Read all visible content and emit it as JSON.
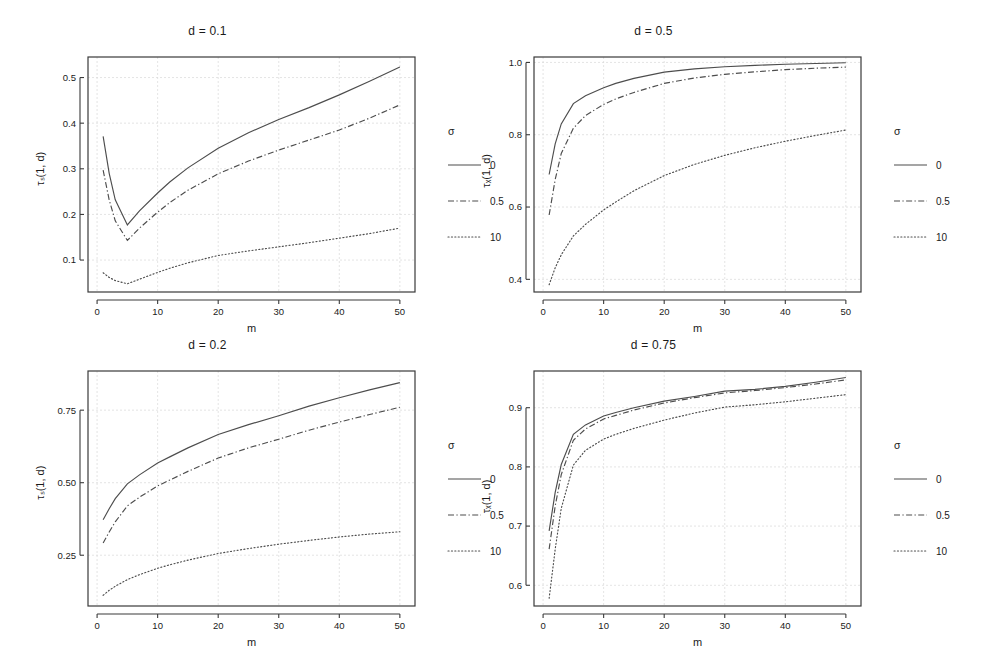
{
  "figure": {
    "width": 992,
    "height": 667,
    "background": "#ffffff",
    "line_color": "#4d4d4d",
    "axis_color": "#3a3a3a",
    "grid_color": "#d9d9d9"
  },
  "legend": {
    "title": "σ",
    "entries": [
      {
        "label": "0",
        "dash": "none"
      },
      {
        "label": "0.5",
        "dash": "dashdot"
      },
      {
        "label": "10",
        "dash": "dotted"
      }
    ]
  },
  "chart_data": [
    {
      "type": "line",
      "title": "d = 0.1",
      "xlabel": "m",
      "ylabel": "τₛ(1, d)",
      "xlim": [
        -1.5,
        52.5
      ],
      "ylim": [
        0.03,
        0.545
      ],
      "xticks": [
        0,
        10,
        20,
        30,
        40,
        50
      ],
      "yticks": [
        0.1,
        0.2,
        0.3,
        0.4,
        0.5
      ],
      "ytick_labels": [
        "0.1",
        "0.2",
        "0.3",
        "0.4",
        "0.5"
      ],
      "grid": true,
      "legend_position": "right",
      "x": [
        1,
        2,
        3,
        5,
        7,
        10,
        12,
        15,
        20,
        25,
        30,
        35,
        40,
        45,
        50
      ],
      "series": [
        {
          "name": "0",
          "dash": "none",
          "values": [
            0.371,
            0.29,
            0.232,
            0.177,
            0.208,
            0.247,
            0.271,
            0.302,
            0.345,
            0.379,
            0.408,
            0.434,
            0.462,
            0.492,
            0.523
          ]
        },
        {
          "name": "0.5",
          "dash": "dashdot",
          "values": [
            0.297,
            0.232,
            0.186,
            0.143,
            0.17,
            0.205,
            0.226,
            0.253,
            0.289,
            0.317,
            0.341,
            0.363,
            0.385,
            0.411,
            0.44
          ]
        },
        {
          "name": "10",
          "dash": "dotted",
          "values": [
            0.072,
            0.062,
            0.055,
            0.048,
            0.058,
            0.073,
            0.082,
            0.094,
            0.11,
            0.12,
            0.129,
            0.138,
            0.148,
            0.158,
            0.17
          ]
        }
      ]
    },
    {
      "type": "line",
      "title": "d = 0.5",
      "xlabel": "m",
      "ylabel": "τₓ(1, d)",
      "xlim": [
        -1.5,
        52.5
      ],
      "ylim": [
        0.365,
        1.015
      ],
      "xticks": [
        0,
        10,
        20,
        30,
        40,
        50
      ],
      "yticks": [
        0.4,
        0.6,
        0.8,
        1.0
      ],
      "ytick_labels": [
        "0.4",
        "0.6",
        "0.8",
        "1.0"
      ],
      "grid": true,
      "legend_position": "right",
      "x": [
        1,
        2,
        3,
        5,
        7,
        10,
        12,
        15,
        20,
        25,
        30,
        35,
        40,
        45,
        50
      ],
      "series": [
        {
          "name": "0",
          "dash": "none",
          "values": [
            0.69,
            0.775,
            0.83,
            0.886,
            0.908,
            0.93,
            0.942,
            0.956,
            0.973,
            0.982,
            0.988,
            0.992,
            0.995,
            0.997,
            0.999
          ]
        },
        {
          "name": "0.5",
          "dash": "dashdot",
          "values": [
            0.578,
            0.676,
            0.748,
            0.818,
            0.853,
            0.884,
            0.899,
            0.917,
            0.942,
            0.957,
            0.967,
            0.974,
            0.98,
            0.984,
            0.987
          ]
        },
        {
          "name": "10",
          "dash": "dotted",
          "values": [
            0.385,
            0.432,
            0.468,
            0.52,
            0.552,
            0.592,
            0.614,
            0.645,
            0.687,
            0.718,
            0.743,
            0.764,
            0.782,
            0.798,
            0.813
          ]
        }
      ]
    },
    {
      "type": "line",
      "title": "d = 0.2",
      "xlabel": "m",
      "ylabel": "τₛ(1, d)",
      "xlim": [
        -1.5,
        52.5
      ],
      "ylim": [
        0.075,
        0.885
      ],
      "xticks": [
        0,
        10,
        20,
        30,
        40,
        50
      ],
      "yticks": [
        0.25,
        0.5,
        0.75
      ],
      "ytick_labels": [
        "0.25",
        "0.50",
        "0.75"
      ],
      "grid": true,
      "legend_position": "right",
      "x": [
        1,
        2,
        3,
        5,
        7,
        10,
        12,
        15,
        20,
        25,
        30,
        35,
        40,
        45,
        50
      ],
      "series": [
        {
          "name": "0",
          "dash": "none",
          "values": [
            0.372,
            0.41,
            0.445,
            0.496,
            0.527,
            0.568,
            0.589,
            0.62,
            0.666,
            0.7,
            0.731,
            0.764,
            0.793,
            0.82,
            0.845
          ]
        },
        {
          "name": "0.5",
          "dash": "dashdot",
          "values": [
            0.292,
            0.33,
            0.365,
            0.42,
            0.45,
            0.489,
            0.509,
            0.539,
            0.585,
            0.62,
            0.65,
            0.681,
            0.709,
            0.735,
            0.76
          ]
        },
        {
          "name": "10",
          "dash": "dotted",
          "values": [
            0.112,
            0.129,
            0.143,
            0.166,
            0.183,
            0.205,
            0.217,
            0.233,
            0.256,
            0.273,
            0.288,
            0.301,
            0.313,
            0.323,
            0.331
          ]
        }
      ]
    },
    {
      "type": "line",
      "title": "d = 0.75",
      "xlabel": "m",
      "ylabel": "τₓ(1, d)",
      "xlim": [
        -1.5,
        52.5
      ],
      "ylim": [
        0.565,
        0.962
      ],
      "xticks": [
        0,
        10,
        20,
        30,
        40,
        50
      ],
      "yticks": [
        0.6,
        0.7,
        0.8,
        0.9
      ],
      "ytick_labels": [
        "0.6",
        "0.7",
        "0.8",
        "0.9"
      ],
      "grid": true,
      "legend_position": "right",
      "x": [
        1,
        2,
        3,
        5,
        7,
        10,
        12,
        15,
        20,
        25,
        30,
        35,
        40,
        45,
        50
      ],
      "series": [
        {
          "name": "0",
          "dash": "none",
          "values": [
            0.692,
            0.757,
            0.804,
            0.855,
            0.871,
            0.886,
            0.892,
            0.9,
            0.911,
            0.919,
            0.928,
            0.931,
            0.936,
            0.943,
            0.951
          ]
        },
        {
          "name": "0.5",
          "dash": "dashdot",
          "values": [
            0.661,
            0.734,
            0.787,
            0.845,
            0.864,
            0.881,
            0.887,
            0.896,
            0.908,
            0.917,
            0.925,
            0.929,
            0.934,
            0.94,
            0.947
          ]
        },
        {
          "name": "10",
          "dash": "dotted",
          "values": [
            0.578,
            0.661,
            0.73,
            0.803,
            0.828,
            0.847,
            0.855,
            0.865,
            0.879,
            0.891,
            0.901,
            0.905,
            0.91,
            0.916,
            0.922
          ]
        }
      ]
    }
  ],
  "panels": [
    {
      "key": "top-left",
      "left": 0,
      "top": 20,
      "width": 496,
      "height": 314
    },
    {
      "key": "top-right",
      "left": 446,
      "top": 20,
      "width": 496,
      "height": 314
    },
    {
      "key": "bottom-left",
      "left": 0,
      "top": 334,
      "width": 496,
      "height": 314
    },
    {
      "key": "bottom-right",
      "left": 446,
      "top": 334,
      "width": 496,
      "height": 314
    }
  ]
}
